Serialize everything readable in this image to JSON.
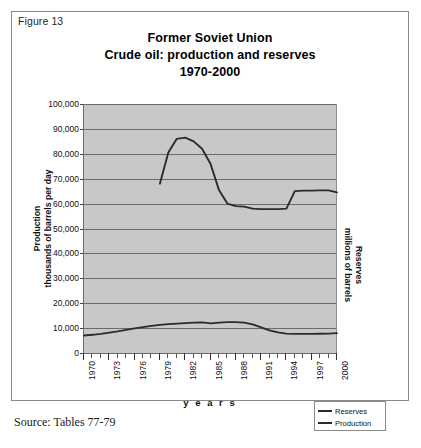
{
  "figure": {
    "label": "Figure 13",
    "source": "Source: Tables 77-79"
  },
  "chart_data": {
    "type": "line",
    "title": "Former Soviet Union\nCrude oil: production and reserves\n1970-2000",
    "title_lines": [
      "Former Soviet Union",
      "Crude oil: production and reserves",
      "1970-2000"
    ],
    "xlabel": "y e a r s",
    "xlabel_plain": "years",
    "ylabel": "Production\nthousands of barrels per day",
    "ylabel_lines": [
      "Production",
      "thousands of barrels per day"
    ],
    "y2label": "Reserves\nmillions of barrels",
    "y2label_lines": [
      "Reserves",
      "millions of barrels"
    ],
    "ylim": [
      0,
      100000
    ],
    "xlim": [
      1970,
      2000
    ],
    "ytick_labels": [
      "100,000",
      "90,000",
      "80,000",
      "70,000",
      "60,000",
      "50,000",
      "40,000",
      "30,000",
      "20,000",
      "10,000",
      "0"
    ],
    "ytick_values": [
      100000,
      90000,
      80000,
      70000,
      60000,
      50000,
      40000,
      30000,
      20000,
      10000,
      0
    ],
    "xtick_labels": [
      "1970",
      "1973",
      "1976",
      "1979",
      "1982",
      "1985",
      "1988",
      "1991",
      "1994",
      "1997",
      "2000"
    ],
    "xtick_values": [
      1970,
      1973,
      1976,
      1979,
      1982,
      1985,
      1988,
      1991,
      1994,
      1997,
      2000
    ],
    "grid": true,
    "plot_background": "#c8c8c8",
    "line_color": "#2b2b2b",
    "legend_position": "bottom-right",
    "series": [
      {
        "name": "Reserves",
        "unit": "millions of barrels",
        "x": [
          1979,
          1980,
          1981,
          1982,
          1983,
          1984,
          1985,
          1986,
          1987,
          1988,
          1989,
          1990,
          1991,
          1992,
          1993,
          1994,
          1995,
          1996,
          1997,
          1998,
          1999,
          2000
        ],
        "values": [
          68000,
          80500,
          86000,
          86500,
          85000,
          82000,
          76000,
          65500,
          60000,
          59000,
          58800,
          58000,
          57800,
          57800,
          57800,
          58000,
          65000,
          65200,
          65200,
          65300,
          65300,
          64500
        ]
      },
      {
        "name": "Production",
        "unit": "thousands of barrels per day",
        "x": [
          1970,
          1971,
          1972,
          1973,
          1974,
          1975,
          1976,
          1977,
          1978,
          1979,
          1980,
          1981,
          1982,
          1983,
          1984,
          1985,
          1986,
          1987,
          1988,
          1989,
          1990,
          1991,
          1992,
          1993,
          1994,
          1995,
          1996,
          1997,
          1998,
          1999,
          2000
        ],
        "values": [
          7000,
          7300,
          7700,
          8200,
          8700,
          9300,
          9900,
          10400,
          10900,
          11300,
          11600,
          11800,
          12000,
          12200,
          12300,
          11900,
          12200,
          12400,
          12400,
          12200,
          11500,
          10300,
          9100,
          8300,
          7800,
          7700,
          7700,
          7700,
          7750,
          7800,
          8000
        ]
      }
    ],
    "legend": [
      {
        "label": "Reserves"
      },
      {
        "label": "Production"
      }
    ]
  }
}
